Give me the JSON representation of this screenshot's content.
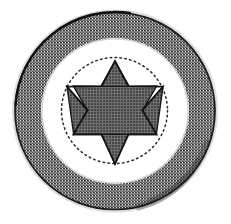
{
  "image": {
    "title": "Circular medallion with Star of David",
    "kind": "halftone-line-drawing",
    "width": 231,
    "height": 224,
    "background_color": "#ffffff"
  },
  "palette": {
    "background": "#ffffff",
    "outline": "#1a1a1a",
    "ring_fill_light": "#d8d8d8",
    "ring_fill_mid": "#b4b4b4",
    "ring_fill_dark": "#6f6f6f",
    "inner_field": "#ffffff",
    "star_fill": "#595959",
    "star_outline": "#171717",
    "dotted_circle": "#2b2b2b",
    "smudge": "#3d3d3d"
  },
  "elements": {
    "outer_circle": {
      "name": "outer circle outline",
      "center_x": 115,
      "center_y": 111,
      "radius_x": 100,
      "radius_y": 98.5,
      "stroke_width": 1.6
    },
    "outer_ring": {
      "name": "textured gray outer ring band",
      "outer_radius_x": 100,
      "outer_radius_y": 98.5,
      "inner_radius_x": 73,
      "inner_radius_y": 72,
      "texture": "halftone dots"
    },
    "inner_field": {
      "name": "plain white inner field",
      "radius_x": 73,
      "radius_y": 72,
      "fill": "#ffffff"
    },
    "dotted_circle": {
      "name": "dotted inscribed circle",
      "center_x": 114.5,
      "center_y": 110.5,
      "radius": 53,
      "dash_pattern": "1.6 3.2",
      "stroke_width": 1.5
    },
    "star": {
      "name": "six-pointed Star of David",
      "points": 6,
      "center_x": 115,
      "center_y": 110,
      "outer_radius": 48,
      "inner_radius": 27.5,
      "rotation_deg": 0,
      "tip_top_y": 62,
      "tip_bottom_y": 164,
      "tip_left_x": 67,
      "tip_right_x": 163,
      "fill": "#595959",
      "texture": "dense cross-hatch halftone"
    },
    "smudge": {
      "name": "dark worn patch on lower-right ring",
      "center_x": 173,
      "center_y": 171,
      "arc_start_deg": 18,
      "arc_end_deg": 82,
      "description": "darker, noisier halftone wear on the lower-right arc of the ring"
    }
  },
  "labels": {
    "alt_text": "Scanned line drawing of a round medallion: a wide stippled gray border ring, a blank white field, a dotted circle, and a dark hatched six-pointed star at the center. The lower-right of the border ring is darker and worn."
  }
}
